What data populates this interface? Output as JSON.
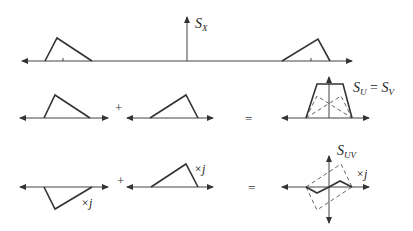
{
  "diagram": {
    "row1": {
      "impulse_label": "S",
      "impulse_sub": "X"
    },
    "row2": {
      "plus": "+",
      "equals": "=",
      "result_label_a": "S",
      "result_sub_a": "U",
      "result_eq": " = ",
      "result_label_b": "S",
      "result_sub_b": "V"
    },
    "row3": {
      "plus": "+",
      "equals": "=",
      "left_factor": "×j",
      "right_factor": "×j",
      "result_factor": "×j",
      "result_label": "S",
      "result_sub": "UV"
    }
  }
}
